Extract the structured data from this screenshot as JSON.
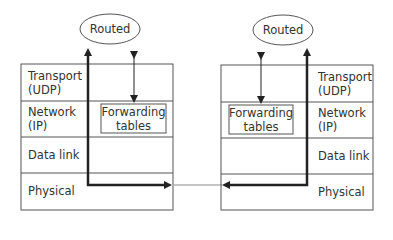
{
  "diagram": {
    "left_router": {
      "daemon_label": "Routed",
      "layers": {
        "transport": [
          "Transport",
          "(UDP)"
        ],
        "network": [
          "Network",
          "(IP)"
        ],
        "datalink": "Data link",
        "physical": "Physical"
      },
      "forwarding": [
        "Forwarding",
        "tables"
      ]
    },
    "right_router": {
      "daemon_label": "Routed",
      "layers": {
        "transport": [
          "Transport",
          "(UDP)"
        ],
        "network": [
          "Network",
          "(IP)"
        ],
        "datalink": "Data link",
        "physical": "Physical"
      },
      "forwarding": [
        "Forwarding",
        "tables"
      ]
    },
    "colors": {
      "line": "#333333",
      "thick_path": "#222222",
      "link": "#b0b0b0",
      "box_border": "#555555"
    }
  }
}
